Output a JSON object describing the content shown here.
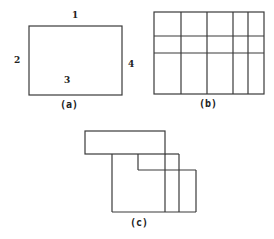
{
  "figures": {
    "a": {
      "caption": "(a)",
      "edge_labels": {
        "top": "1",
        "left": "2",
        "bottom": "3",
        "right": "4"
      }
    },
    "b": {
      "caption": "(b)",
      "grid": {
        "columns": 5,
        "rows": 3
      }
    },
    "c": {
      "caption": "(c)",
      "description": "three overlapping stepped rectangles"
    }
  },
  "colors": {
    "line": "#3a3a3a",
    "text": "#222222",
    "background": "#ffffff"
  }
}
